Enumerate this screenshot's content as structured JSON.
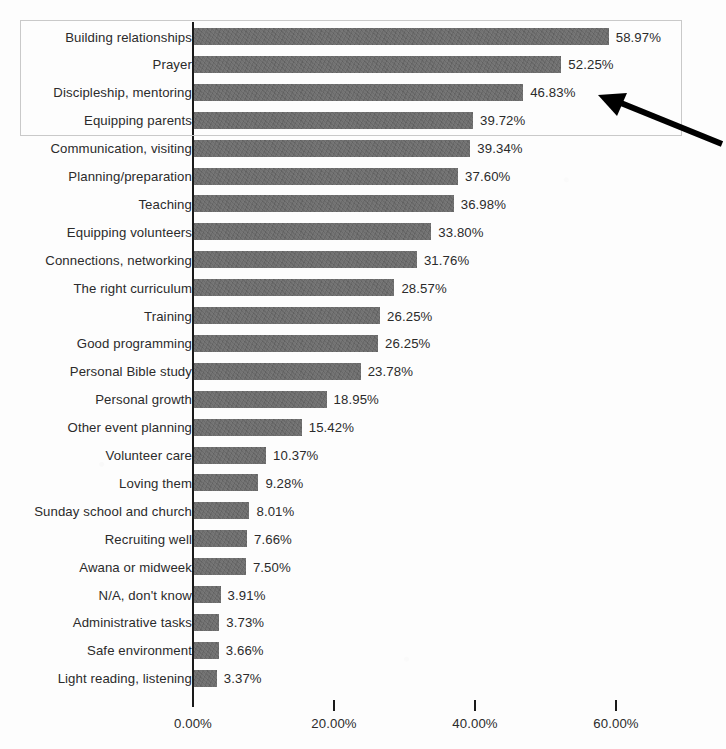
{
  "chart_data": {
    "type": "bar",
    "orientation": "horizontal",
    "title": "",
    "subtitle": "",
    "xlabel": "",
    "ylabel": "",
    "xlim": [
      0,
      65
    ],
    "x_ticks": [
      "0.00%",
      "20.00%",
      "40.00%",
      "60.00%"
    ],
    "x_tick_values": [
      0,
      20,
      40,
      60
    ],
    "grid": false,
    "legend": "none",
    "value_format": "percent-2dp",
    "bar_color": "#696969",
    "text_color": "#2b2b2b",
    "axis_color": "#1a1a1a",
    "categories": [
      "Building relationships",
      "Prayer",
      "Discipleship, mentoring",
      "Equipping parents",
      "Communication, visiting",
      "Planning/preparation",
      "Teaching",
      "Equipping volunteers",
      "Connections, networking",
      "The right curriculum",
      "Training",
      "Good programming",
      "Personal Bible study",
      "Personal growth",
      "Other event planning",
      "Volunteer care",
      "Loving them",
      "Sunday school and church",
      "Recruiting well",
      "Awana or midweek",
      "N/A, don't know",
      "Administrative tasks",
      "Safe environment",
      "Light reading, listening"
    ],
    "values": [
      58.97,
      52.25,
      46.83,
      39.72,
      39.34,
      37.6,
      36.98,
      33.8,
      31.76,
      28.57,
      26.54,
      26.25,
      23.78,
      18.95,
      15.42,
      10.37,
      9.28,
      8.01,
      7.66,
      7.5,
      3.91,
      3.73,
      3.66,
      3.37
    ],
    "value_labels": [
      "58.97%",
      "52.25%",
      "46.83%",
      "39.72%",
      "39.34%",
      "37.60%",
      "36.98%",
      "33.80%",
      "31.76%",
      "28.57%",
      "26.25%",
      "26.25%",
      "23.78%",
      "18.95%",
      "15.42%",
      "10.37%",
      "9.28%",
      "8.01%",
      "7.66%",
      "7.50%",
      "3.91%",
      "3.73%",
      "3.66%",
      "3.37%"
    ]
  },
  "annotations": {
    "highlight_box": {
      "label": "top-four-highlight",
      "covers": [
        "Building relationships",
        "Prayer",
        "Discipleship, mentoring",
        "Equipping parents"
      ],
      "border_color": "#c9c9c9"
    },
    "arrow": {
      "label": "callout-arrow",
      "points_to": "Discipleship, mentoring",
      "color": "#000000"
    }
  }
}
